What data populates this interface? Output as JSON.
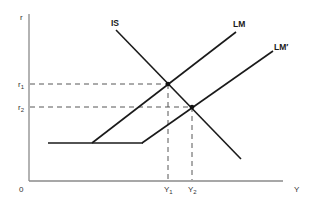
{
  "diagram": {
    "axes": {
      "y_label": "r",
      "x_label": "Y",
      "origin_label": "0"
    },
    "curves": [
      {
        "id": "IS",
        "label": "IS"
      },
      {
        "id": "LM",
        "label": "LM"
      },
      {
        "id": "LM_prime",
        "label": "LM′"
      }
    ],
    "ticks": {
      "r1": {
        "base": "r",
        "sub": "1"
      },
      "r2": {
        "base": "r",
        "sub": "2"
      },
      "Y1": {
        "base": "Y",
        "sub": "1"
      },
      "Y2": {
        "base": "Y",
        "sub": "2"
      }
    },
    "colors": {
      "curve": "#1a1a1a",
      "axis": "#8a8a8a",
      "dash": "#444444"
    }
  }
}
